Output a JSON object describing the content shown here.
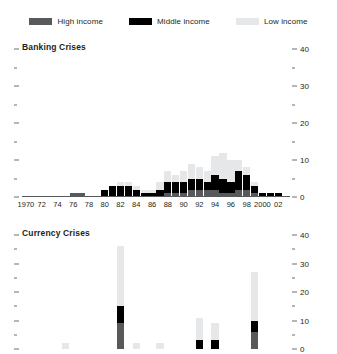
{
  "legend": {
    "entries": [
      {
        "label": "High income",
        "color": "#58595b",
        "icon": "legend-swatch-high-income"
      },
      {
        "label": "Middle income",
        "color": "#000000",
        "icon": "legend-swatch-middle-income"
      },
      {
        "label": "Low income",
        "color": "#e6e7e8",
        "icon": "legend-swatch-low-income"
      }
    ]
  },
  "colors": {
    "high_income": "#58595b",
    "middle_income": "#000000",
    "low_income": "#e6e7e8",
    "axis": "#58595b",
    "text": "#231f20"
  },
  "axis": {
    "x_tick_labels": [
      "1970",
      "72",
      "74",
      "76",
      "78",
      "80",
      "82",
      "84",
      "86",
      "88",
      "90",
      "92",
      "94",
      "96",
      "98",
      "2000",
      "02"
    ],
    "x_tick_years": [
      1970,
      1972,
      1974,
      1976,
      1978,
      1980,
      1982,
      1984,
      1986,
      1988,
      1990,
      1992,
      1994,
      1996,
      1998,
      2000,
      2002
    ],
    "y_major_labels": [
      "0",
      "10",
      "20",
      "30",
      "40"
    ],
    "y_major_values": [
      0,
      10,
      20,
      30,
      40
    ],
    "y_minor_values": [
      5,
      15,
      25,
      35
    ],
    "ylim": [
      0,
      40
    ]
  },
  "chart_data": [
    {
      "type": "bar",
      "title": "Banking Crises",
      "stacked": true,
      "xlabel": "",
      "ylabel": "",
      "ylim": [
        0,
        40
      ],
      "grid": false,
      "legend_position": "top-center",
      "axis_position": "right",
      "categories": [
        1970,
        1971,
        1972,
        1973,
        1974,
        1975,
        1976,
        1977,
        1978,
        1979,
        1980,
        1981,
        1982,
        1983,
        1984,
        1985,
        1986,
        1987,
        1988,
        1989,
        1990,
        1991,
        1992,
        1993,
        1994,
        1995,
        1996,
        1997,
        1998,
        1999,
        2000,
        2001,
        2002,
        2003
      ],
      "series": [
        {
          "name": "High income",
          "color": "#58595b",
          "values": [
            0,
            0,
            0,
            0,
            0,
            0,
            1,
            1,
            0,
            0,
            0,
            0,
            0,
            0,
            0,
            0,
            0,
            0,
            1,
            1,
            1,
            2,
            2,
            2,
            2,
            1,
            1,
            2,
            2,
            1,
            0,
            0,
            0,
            0
          ]
        },
        {
          "name": "Middle income",
          "color": "#000000",
          "values": [
            0,
            0,
            0,
            0,
            0,
            0,
            0,
            0,
            0,
            0,
            2,
            3,
            3,
            3,
            2,
            1,
            1,
            2,
            3,
            3,
            3,
            3,
            3,
            2,
            4,
            4,
            3,
            5,
            4,
            2,
            1,
            1,
            1,
            0
          ]
        },
        {
          "name": "Low income",
          "color": "#e6e7e8",
          "values": [
            0,
            0,
            0,
            0,
            0,
            0,
            0,
            0,
            0,
            0,
            0,
            0,
            1,
            1,
            1,
            1,
            1,
            2,
            3,
            2,
            3,
            4,
            3,
            3,
            5,
            7,
            6,
            3,
            2,
            1,
            0,
            0,
            0,
            0
          ]
        }
      ]
    },
    {
      "type": "bar",
      "title": "Currency Crises",
      "stacked": true,
      "xlabel": "",
      "ylabel": "",
      "ylim": [
        0,
        40
      ],
      "grid": false,
      "legend_position": "top-center",
      "axis_position": "right",
      "categories": [
        1970,
        1971,
        1972,
        1973,
        1974,
        1975,
        1976,
        1977,
        1978,
        1979,
        1980,
        1981,
        1982,
        1983,
        1984,
        1985,
        1986,
        1987,
        1988,
        1989,
        1990,
        1991,
        1992,
        1993,
        1994,
        1995,
        1996,
        1997,
        1998,
        1999,
        2000,
        2001,
        2002,
        2003
      ],
      "series": [
        {
          "name": "High income",
          "color": "#58595b",
          "values": [
            0,
            0,
            0,
            0,
            0,
            0,
            0,
            0,
            0,
            0,
            0,
            0,
            9,
            0,
            0,
            0,
            0,
            0,
            0,
            0,
            0,
            0,
            0,
            0,
            0,
            0,
            0,
            0,
            0,
            6,
            0,
            0,
            0,
            0
          ]
        },
        {
          "name": "Middle income",
          "color": "#000000",
          "values": [
            0,
            0,
            0,
            0,
            0,
            0,
            0,
            0,
            0,
            0,
            0,
            0,
            6,
            0,
            0,
            0,
            0,
            0,
            0,
            0,
            0,
            0,
            3,
            0,
            3,
            0,
            0,
            0,
            0,
            4,
            0,
            0,
            0,
            0
          ]
        },
        {
          "name": "Low income",
          "color": "#e6e7e8",
          "values": [
            0,
            0,
            0,
            0,
            0,
            2,
            0,
            0,
            0,
            0,
            0,
            0,
            21,
            0,
            2,
            0,
            0,
            2,
            0,
            0,
            0,
            0,
            8,
            0,
            6,
            0,
            0,
            0,
            0,
            17,
            0,
            0,
            0,
            0
          ]
        }
      ]
    }
  ]
}
